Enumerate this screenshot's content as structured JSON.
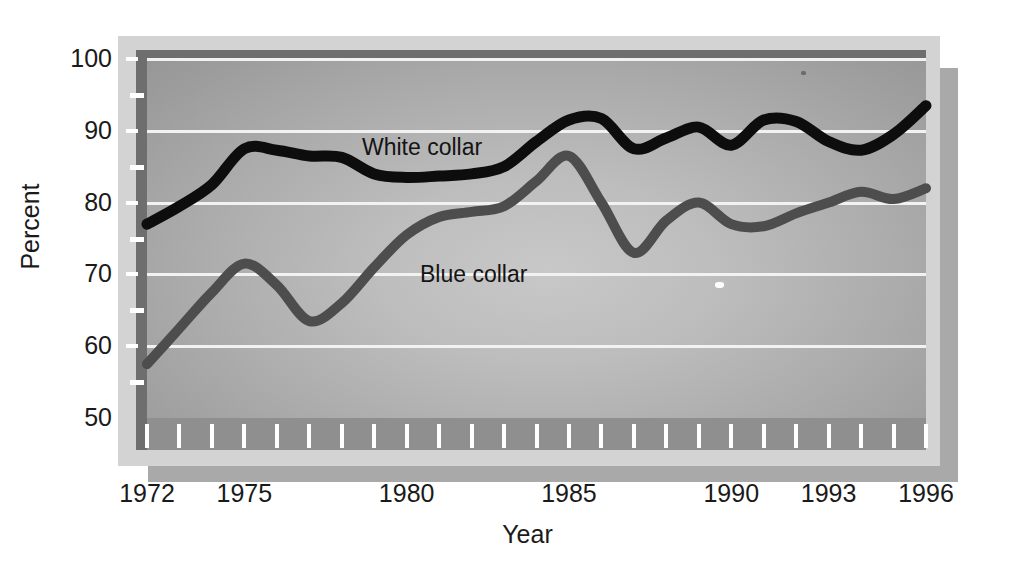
{
  "chart_data": {
    "type": "line",
    "title": "",
    "xlabel": "Year",
    "ylabel": "Percent",
    "xlim": [
      1972,
      1996
    ],
    "ylim": [
      50,
      100
    ],
    "grid": true,
    "grid_values": [
      100,
      90,
      80,
      70,
      60
    ],
    "y_minor_ticks": [
      95,
      85,
      75,
      65,
      55
    ],
    "y_tick_labels": [
      "100",
      "90",
      "80",
      "70",
      "60",
      "50"
    ],
    "y_tick_values": [
      100,
      90,
      80,
      70,
      60,
      50
    ],
    "x_tick_labels": [
      "1972",
      "1975",
      "1980",
      "1985",
      "1990",
      "1993",
      "1996"
    ],
    "x_tick_values": [
      1972,
      1975,
      1980,
      1985,
      1990,
      1993,
      1996
    ],
    "legend_position": "inline-annotations",
    "x": [
      1972,
      1973,
      1974,
      1975,
      1976,
      1977,
      1978,
      1979,
      1980,
      1981,
      1982,
      1983,
      1984,
      1985,
      1986,
      1987,
      1988,
      1989,
      1990,
      1991,
      1992,
      1993,
      1994,
      1995,
      1996
    ],
    "series": [
      {
        "name": "White collar",
        "color": "#0d0d0d",
        "values": [
          77.0,
          79.5,
          82.5,
          87.5,
          87.3,
          86.5,
          86.3,
          84.0,
          83.5,
          83.7,
          84.0,
          85.0,
          88.5,
          91.5,
          91.7,
          87.5,
          89.0,
          90.5,
          88.0,
          91.5,
          91.3,
          88.5,
          87.3,
          89.5,
          93.5
        ]
      },
      {
        "name": "Blue collar",
        "color": "#4d4d4d",
        "values": [
          57.5,
          62.5,
          67.5,
          71.5,
          68.5,
          63.5,
          66.0,
          71.0,
          75.5,
          78.0,
          78.7,
          79.5,
          83.0,
          86.5,
          80.0,
          73.0,
          77.5,
          80.0,
          77.0,
          76.7,
          78.5,
          80.0,
          81.5,
          80.5,
          82.0
        ]
      }
    ],
    "annotations": [
      {
        "text": "White collar",
        "x": 1980.0,
        "y": 88.0
      },
      {
        "text": "Blue collar",
        "x": 1981.8,
        "y": 72.5
      }
    ]
  },
  "axes": {
    "y_title": "Percent",
    "x_title": "Year"
  },
  "colors": {
    "panel_light": "#c8c8c8",
    "panel_dark": "#929292",
    "frame": "#d3d3d3",
    "bevel": "#6e6e6e",
    "gridline": "#f2f2f2",
    "white_collar": "#0d0d0d",
    "blue_collar": "#4d4d4d",
    "shadow": "#a9a9a9",
    "text": "#1a1a1a"
  }
}
